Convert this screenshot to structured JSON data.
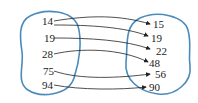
{
  "diagram": {
    "type": "relation-mapping",
    "colors": {
      "outline": "#4a8bbd",
      "arrow": "#222222"
    },
    "domain": [
      "14",
      "19",
      "28",
      "75",
      "94"
    ],
    "codomain": [
      "15",
      "19",
      "22",
      "48",
      "56",
      "90"
    ],
    "arrows": [
      {
        "from": "14",
        "to": "15"
      },
      {
        "from": "14",
        "to": "19"
      },
      {
        "from": "19",
        "to": "22"
      },
      {
        "from": "28",
        "to": "48"
      },
      {
        "from": "75",
        "to": "56"
      },
      {
        "from": "94",
        "to": "90"
      }
    ]
  }
}
